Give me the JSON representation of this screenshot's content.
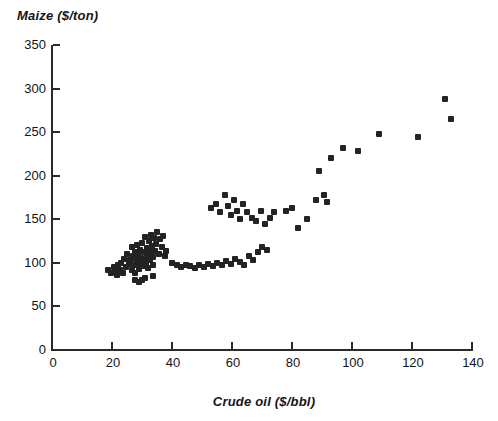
{
  "chart_data": {
    "type": "scatter",
    "title": "",
    "xlabel": "Crude oil ($/bbl)",
    "ylabel": "Maize ($/ton)",
    "xlim": [
      0,
      140
    ],
    "ylim": [
      0,
      350
    ],
    "xticks": [
      0,
      20,
      40,
      60,
      80,
      100,
      120,
      140
    ],
    "yticks": [
      0,
      50,
      100,
      150,
      200,
      250,
      300,
      350
    ],
    "grid": false,
    "legend": null,
    "marker": {
      "shape": "square",
      "color": "#232323",
      "size": 6
    },
    "series": [
      {
        "name": "Maize vs Crude oil",
        "points": [
          [
            18.5,
            92
          ],
          [
            19.5,
            88
          ],
          [
            20.5,
            95
          ],
          [
            21.0,
            90
          ],
          [
            21.5,
            86
          ],
          [
            22.0,
            98
          ],
          [
            22.5,
            92
          ],
          [
            23.0,
            100
          ],
          [
            23.5,
            88
          ],
          [
            24.0,
            105
          ],
          [
            24.5,
            95
          ],
          [
            25.0,
            110
          ],
          [
            25.5,
            99
          ],
          [
            26.0,
            103
          ],
          [
            26.5,
            92
          ],
          [
            26.8,
            118
          ],
          [
            27.0,
            108
          ],
          [
            27.3,
            97
          ],
          [
            27.5,
            112
          ],
          [
            27.8,
            88
          ],
          [
            28.0,
            104
          ],
          [
            28.2,
            120
          ],
          [
            28.5,
            99
          ],
          [
            28.8,
            110
          ],
          [
            29.0,
            93
          ],
          [
            29.2,
            115
          ],
          [
            29.5,
            106
          ],
          [
            29.8,
            101
          ],
          [
            30.0,
            123
          ],
          [
            30.2,
            96
          ],
          [
            30.5,
            112
          ],
          [
            30.8,
            104
          ],
          [
            31.0,
            130
          ],
          [
            31.2,
            99
          ],
          [
            31.5,
            117
          ],
          [
            31.8,
            108
          ],
          [
            32.0,
            94
          ],
          [
            32.3,
            125
          ],
          [
            32.5,
            112
          ],
          [
            32.8,
            103
          ],
          [
            33.0,
            132
          ],
          [
            33.3,
            119
          ],
          [
            33.5,
            107
          ],
          [
            33.8,
            98
          ],
          [
            34.0,
            128
          ],
          [
            34.3,
            114
          ],
          [
            34.5,
            122
          ],
          [
            35.0,
            135
          ],
          [
            35.5,
            110
          ],
          [
            36.0,
            127
          ],
          [
            36.5,
            118
          ],
          [
            37.0,
            131
          ],
          [
            37.5,
            108
          ],
          [
            38.0,
            114
          ],
          [
            29.0,
            78
          ],
          [
            30.0,
            80
          ],
          [
            31.0,
            83
          ],
          [
            27.5,
            80
          ],
          [
            33.5,
            85
          ],
          [
            40.0,
            100
          ],
          [
            41.5,
            97
          ],
          [
            43.0,
            95
          ],
          [
            44.5,
            98
          ],
          [
            46.0,
            96
          ],
          [
            47.5,
            94
          ],
          [
            49.0,
            97
          ],
          [
            50.5,
            95
          ],
          [
            52.0,
            99
          ],
          [
            53.5,
            96
          ],
          [
            55.0,
            100
          ],
          [
            56.5,
            98
          ],
          [
            58.0,
            102
          ],
          [
            59.5,
            99
          ],
          [
            61.0,
            105
          ],
          [
            62.5,
            101
          ],
          [
            64.0,
            97
          ],
          [
            65.5,
            108
          ],
          [
            67.0,
            103
          ],
          [
            68.5,
            113
          ],
          [
            70.0,
            118
          ],
          [
            71.5,
            115
          ],
          [
            53.0,
            163
          ],
          [
            54.5,
            168
          ],
          [
            56.0,
            158
          ],
          [
            57.5,
            178
          ],
          [
            58.5,
            165
          ],
          [
            59.5,
            155
          ],
          [
            60.5,
            172
          ],
          [
            61.5,
            160
          ],
          [
            62.5,
            150
          ],
          [
            63.5,
            168
          ],
          [
            65.0,
            158
          ],
          [
            66.5,
            152
          ],
          [
            68.0,
            148
          ],
          [
            69.5,
            160
          ],
          [
            71.0,
            145
          ],
          [
            72.5,
            152
          ],
          [
            74.0,
            158
          ],
          [
            78.0,
            160
          ],
          [
            80.0,
            163
          ],
          [
            82.0,
            140
          ],
          [
            85.0,
            150
          ],
          [
            88.0,
            172
          ],
          [
            89.0,
            205
          ],
          [
            90.5,
            178
          ],
          [
            91.5,
            170
          ],
          [
            93.0,
            220
          ],
          [
            97.0,
            232
          ],
          [
            102.0,
            228
          ],
          [
            109.0,
            248
          ],
          [
            122.0,
            244
          ],
          [
            131.0,
            288
          ],
          [
            133.0,
            265
          ]
        ]
      }
    ]
  }
}
